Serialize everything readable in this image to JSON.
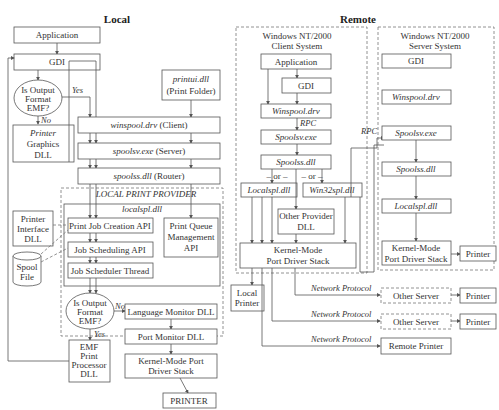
{
  "headings": {
    "local": "Local",
    "remote": "Remote"
  },
  "local": {
    "application": "Application",
    "gdi": "GDI",
    "decision1": [
      "Is Output",
      "Format",
      "EMF?"
    ],
    "yes": "Yes",
    "no": "No",
    "printer_graphics": [
      "Printer",
      "Graphics",
      "DLL"
    ],
    "printui": [
      "printui.dll",
      "(Print Folder)"
    ],
    "winspool": {
      "name": "winspool.drv",
      "role": "(Client)"
    },
    "spoolsv": {
      "name": "spoolsv.exe",
      "role": "(Server)"
    },
    "spoolss": {
      "name": "spoolss.dll",
      "role": "(Router)"
    },
    "provider_title": "LOCAL PRINT PROVIDER",
    "localspl": "localspl.dll",
    "printer_interface": [
      "Printer",
      "Interface",
      "DLL"
    ],
    "print_job_creation": "Print Job Creation API",
    "print_queue_mgmt": [
      "Print Queue",
      "Management",
      "API"
    ],
    "job_scheduling": "Job Scheduling API",
    "job_scheduler_thread": "Job Scheduler Thread",
    "spool_file": [
      "Spool",
      "File"
    ],
    "decision2": [
      "Is Output",
      "Format",
      "EMF?"
    ],
    "no2": "No",
    "yes2": "Yes",
    "language_monitor": "Language Monitor DLL",
    "port_monitor": "Port Monitor DLL",
    "kernel_port": [
      "Kernel-Mode Port",
      "Driver Stack"
    ],
    "emf_processor": [
      "EMF",
      "Print",
      "Processor",
      "DLL"
    ],
    "printer": "PRINTER"
  },
  "remote": {
    "client_title": [
      "Windows NT/2000",
      "Client System"
    ],
    "server_title": [
      "Windows NT/2000",
      "Server System"
    ],
    "client": {
      "application": "Application",
      "gdi": "GDI",
      "winspool": "Winspool.drv",
      "rpc": "RPC",
      "spoolsv": "Spoolsv.exe",
      "spoolss": "Spoolss.dll",
      "or1": "– or –",
      "or2": "– or –",
      "localspl": "Localspl.dll",
      "win32spl": "Win32spl.dll",
      "other_provider": [
        "Other Provider",
        "DLL"
      ],
      "kernel": [
        "Kernel-Mode",
        "Port Driver Stack"
      ]
    },
    "server": {
      "gdi": "GDI",
      "winspool": "Winspool.drv",
      "spoolsv": "Spoolsv.exe",
      "spoolss": "Spoolss.dll",
      "localspl": "Localspl.dll",
      "kernel": [
        "Kernel-Mode",
        "Port Driver Stack"
      ],
      "printer": "Printer"
    },
    "rpc_link": "RPC",
    "local_printer": [
      "Local",
      "Printer"
    ],
    "network_protocol": "Network Protocol",
    "other_server": "Other Server",
    "printer": "Printer",
    "remote_printer": "Remote Printer"
  }
}
